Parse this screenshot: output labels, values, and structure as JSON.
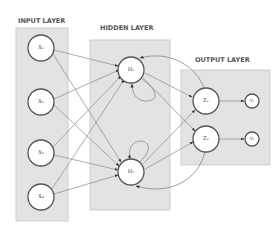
{
  "diagram": {
    "type": "recurrent neural network",
    "layers": [
      {
        "id": "input",
        "label": "INPUT LAYER",
        "nodes": [
          "X1",
          "X2",
          "X3",
          "X4"
        ]
      },
      {
        "id": "hidden",
        "label": "HIDDEN LAYER",
        "nodes": [
          "H1",
          "H2"
        ]
      },
      {
        "id": "output",
        "label": "OUTPUT LAYER",
        "nodes": [
          "Z1",
          "Z2"
        ],
        "outputs": [
          "Y1",
          "Y2"
        ]
      }
    ],
    "node_labels": {
      "x1": "X₁",
      "x2": "X₂",
      "x3": "X₃",
      "x4": "X₄",
      "h1": "H₁",
      "h2": "H₂",
      "z1": "Z₁",
      "z2": "Z₂",
      "y1": "Y₁",
      "y2": "Y₂"
    },
    "labels": {
      "input_layer": "INPUT LAYER",
      "hidden_layer": "HIDDEN LAYER",
      "output_layer": "OUTPUT LAYER"
    },
    "edges": [
      [
        "X1",
        "H1"
      ],
      [
        "X1",
        "H2"
      ],
      [
        "X2",
        "H1"
      ],
      [
        "X2",
        "H2"
      ],
      [
        "X3",
        "H1"
      ],
      [
        "X3",
        "H2"
      ],
      [
        "X4",
        "H1"
      ],
      [
        "X4",
        "H2"
      ],
      [
        "H1",
        "H1"
      ],
      [
        "H2",
        "H2"
      ],
      [
        "H1",
        "Z1"
      ],
      [
        "H1",
        "Z2"
      ],
      [
        "H2",
        "Z1"
      ],
      [
        "H2",
        "Z2"
      ],
      [
        "Z1",
        "H1"
      ],
      [
        "Z2",
        "H2"
      ],
      [
        "Z1",
        "Y1"
      ],
      [
        "Z2",
        "Y2"
      ]
    ],
    "colors": {
      "box_fill": "#e3e3e3",
      "node_stroke": "#555555",
      "edge": "#8a8a8a",
      "label": "#555555"
    }
  }
}
